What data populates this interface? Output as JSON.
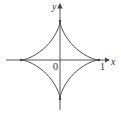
{
  "figure": {
    "type": "astroid-plot",
    "curve": "x^(2/3) + y^(2/3) = 1",
    "labels": {
      "x_axis": "x",
      "y_axis": "y",
      "origin": "0",
      "x_tick": "1"
    },
    "colors": {
      "stroke": "#444444",
      "background": "#ffffff"
    }
  }
}
